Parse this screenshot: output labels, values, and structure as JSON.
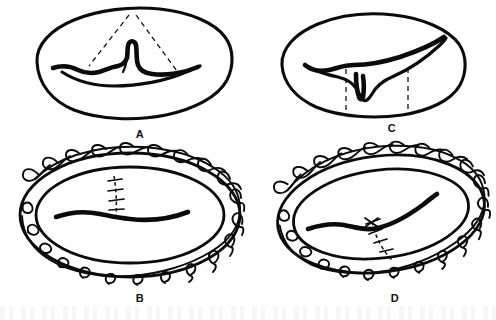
{
  "figure": {
    "style": "black-and-white line drawing",
    "ink_color": "#0b0b0b",
    "background_color": "#ffffff"
  },
  "panels": [
    {
      "id": "A",
      "label": "A",
      "position": "top-left",
      "caption": "",
      "description": "Oval organ cross-section with an irregular horizontal defect and a raised central flap; two dashed guide lines converge toward the superior margin.",
      "features": [
        {
          "name": "organ-outline",
          "type": "closed-contour"
        },
        {
          "name": "defect-line",
          "type": "heavy-irregular-line"
        },
        {
          "name": "central-flap",
          "type": "raised-projection"
        },
        {
          "name": "guide-line-left",
          "type": "dashed"
        },
        {
          "name": "guide-line-right",
          "type": "dashed"
        }
      ]
    },
    {
      "id": "B",
      "label": "B",
      "position": "bottom-left",
      "caption": "",
      "description": "Oval rim encircled by a continuous running locked suture; inner defect closed with a short vertical interrupted stitch line at the centre.",
      "features": [
        {
          "name": "outer-ring",
          "type": "closed-contour"
        },
        {
          "name": "inner-ring",
          "type": "closed-contour"
        },
        {
          "name": "running-locked-suture",
          "type": "continuous-thread"
        },
        {
          "name": "defect-line",
          "type": "heavy-irregular-line"
        },
        {
          "name": "vertical-stitch-line",
          "type": "interrupted-sutures"
        }
      ],
      "suture_loop_count": 22
    },
    {
      "id": "C",
      "label": "C",
      "position": "top-right",
      "caption": "",
      "description": "Oval organ cross-section with a long horizontal defect and a downward-pointing central notch; two vertical dashed guide lines bracket the notch.",
      "features": [
        {
          "name": "organ-outline",
          "type": "closed-contour"
        },
        {
          "name": "defect-line",
          "type": "heavy-irregular-line"
        },
        {
          "name": "central-notch",
          "type": "downward-projection"
        },
        {
          "name": "guide-line-left",
          "type": "dashed-vertical"
        },
        {
          "name": "guide-line-right",
          "type": "dashed-vertical"
        }
      ]
    },
    {
      "id": "D",
      "label": "D",
      "position": "bottom-right",
      "caption": "",
      "description": "Oval rim encircled by a continuous running locked suture; inner defect repaired with an oblique dashed stitch line bearing a cross-stitch knot.",
      "features": [
        {
          "name": "outer-ring",
          "type": "closed-contour"
        },
        {
          "name": "inner-ring",
          "type": "closed-contour"
        },
        {
          "name": "running-locked-suture",
          "type": "continuous-thread"
        },
        {
          "name": "defect-line",
          "type": "heavy-irregular-line"
        },
        {
          "name": "oblique-stitch-line",
          "type": "dashed-sutures"
        },
        {
          "name": "cross-stitch-knot",
          "type": "x-knot"
        }
      ],
      "suture_loop_count": 22
    }
  ]
}
